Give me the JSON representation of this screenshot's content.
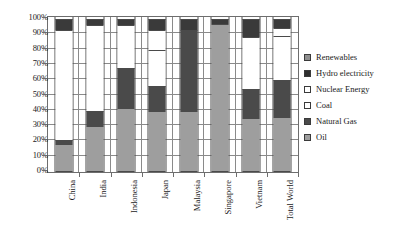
{
  "chart_data": {
    "type": "bar",
    "subtype": "stacked-100-percent",
    "title": "",
    "xlabel": "",
    "ylabel": "",
    "ylim": [
      0,
      100
    ],
    "ytick_labels": [
      "100%",
      "90%",
      "80%",
      "70%",
      "60%",
      "50%",
      "40%",
      "30%",
      "20%",
      "10%",
      "0%"
    ],
    "ytick_values": [
      100,
      90,
      80,
      70,
      60,
      50,
      40,
      30,
      20,
      10,
      0
    ],
    "grid": true,
    "legend_position": "right",
    "categories": [
      "China",
      "India",
      "Indonesia",
      "Japan",
      "Malaysia",
      "Singapore",
      "Vietnam",
      "Total World"
    ],
    "series": [
      {
        "name": "Oil",
        "color": "#9e9e9e",
        "values": [
          18,
          30,
          42,
          40,
          40,
          97,
          35,
          36
        ]
      },
      {
        "name": "Natural Gas",
        "color": "#4a4a4a",
        "values": [
          3,
          10,
          26,
          16,
          53,
          0,
          19,
          24
        ]
      },
      {
        "name": "Coal",
        "color": "#ffffff",
        "values": [
          72,
          56,
          28,
          24,
          0,
          0,
          34,
          29
        ]
      },
      {
        "name": "Nuclear Energy",
        "color": "#ffffff",
        "values": [
          0,
          0,
          0,
          13,
          0,
          0,
          0,
          5
        ]
      },
      {
        "name": "Hydro electricity",
        "color": "#3a3a3a",
        "values": [
          7,
          4,
          4,
          7,
          7,
          3,
          12,
          6
        ]
      },
      {
        "name": "Renewables",
        "color": "#8f8f8f",
        "values": [
          0,
          0,
          0,
          0,
          0,
          0,
          0,
          0
        ]
      }
    ],
    "legend_entries": [
      {
        "label": "Renewables",
        "swatch_color": "#8f8f8f"
      },
      {
        "label": "Hydro electricity",
        "swatch_color": "#2e2e2e"
      },
      {
        "label": "Nuclear Energy",
        "swatch_color": "#ffffff"
      },
      {
        "label": "Coal",
        "swatch_color": "#ffffff"
      },
      {
        "label": "Natural Gas",
        "swatch_color": "#4a4a4a"
      },
      {
        "label": "Oil",
        "swatch_color": "#9e9e9e"
      }
    ]
  }
}
